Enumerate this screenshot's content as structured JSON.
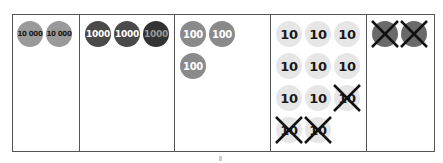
{
  "diagram": {
    "columns": [
      {
        "place": "ten-thousands",
        "coin_value": "10 000",
        "coin_color": "#9a9a9a",
        "text_color": "#1a1a1a",
        "font_size": 7,
        "coins": [
          {
            "label": "10 000",
            "crossed": false
          },
          {
            "label": "10 000",
            "crossed": false
          }
        ]
      },
      {
        "place": "thousands",
        "coin_value": "1000",
        "coin_color": "#4a4a4a",
        "text_color": "#ffffff",
        "font_size": 9,
        "coins": [
          {
            "label": "1000",
            "crossed": false
          },
          {
            "label": "1000",
            "crossed": false
          },
          {
            "label": "1000",
            "crossed": false
          }
        ]
      },
      {
        "place": "hundreds",
        "coin_value": "100",
        "coin_color": "#8a8a8a",
        "text_color": "#ffffff",
        "font_size": 10,
        "coins": [
          {
            "label": "100",
            "crossed": false
          },
          {
            "label": "100",
            "crossed": false
          },
          {
            "label": "100",
            "crossed": false
          }
        ]
      },
      {
        "place": "tens",
        "coin_value": "10",
        "coin_color": "#e6e6e6",
        "text_color": "#1a1a1a",
        "font_size": 13,
        "coins": [
          {
            "label": "10",
            "crossed": false
          },
          {
            "label": "10",
            "crossed": false
          },
          {
            "label": "10",
            "crossed": false
          },
          {
            "label": "10",
            "crossed": false
          },
          {
            "label": "10",
            "crossed": false
          },
          {
            "label": "10",
            "crossed": false
          },
          {
            "label": "10",
            "crossed": false
          },
          {
            "label": "10",
            "crossed": false
          },
          {
            "label": "10",
            "crossed": true
          },
          {
            "label": "10",
            "crossed": true
          },
          {
            "label": "10",
            "crossed": true
          }
        ]
      },
      {
        "place": "ones",
        "coin_value": "1",
        "coin_color": "#6a6a6a",
        "text_color": "#1a1a1a",
        "font_size": 10,
        "coins": [
          {
            "label": "",
            "crossed": true
          },
          {
            "label": "",
            "crossed": true
          }
        ]
      }
    ]
  }
}
